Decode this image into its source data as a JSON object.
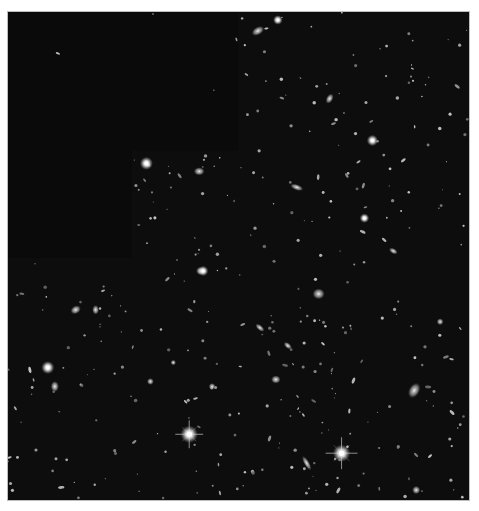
{
  "image": {
    "subject": "deep-field-galaxies",
    "background_color": "#0d0d0d",
    "masked_color": "#0a0a0a",
    "frame_border_color": "#bdbdbd",
    "frame": {
      "x": 7,
      "y": 11,
      "w": 463,
      "h": 490
    },
    "masked_regions": [
      {
        "x": 0,
        "y": 0,
        "w": 231,
        "h": 139
      },
      {
        "x": 0,
        "y": 139,
        "w": 124,
        "h": 108
      }
    ],
    "bright_stars": [
      {
        "x": 182,
        "y": 424,
        "r": 4,
        "spike": 14
      },
      {
        "x": 335,
        "y": 443,
        "r": 4,
        "spike": 16
      },
      {
        "x": 40,
        "y": 357,
        "r": 3,
        "spike": 0
      },
      {
        "x": 139,
        "y": 152,
        "r": 3,
        "spike": 0
      },
      {
        "x": 366,
        "y": 129,
        "r": 2.6,
        "spike": 0
      },
      {
        "x": 196,
        "y": 260,
        "r": 2.4,
        "spike": 0
      },
      {
        "x": 271,
        "y": 8,
        "r": 2.2,
        "spike": 0
      },
      {
        "x": 358,
        "y": 207,
        "r": 2.2,
        "spike": 0
      }
    ],
    "galaxies": [
      {
        "x": 251,
        "y": 19,
        "rx": 5,
        "ry": 3,
        "rot": -30
      },
      {
        "x": 323,
        "y": 87,
        "rx": 4,
        "ry": 2.5,
        "rot": -60
      },
      {
        "x": 290,
        "y": 176,
        "rx": 5,
        "ry": 2.2,
        "rot": 20
      },
      {
        "x": 192,
        "y": 160,
        "rx": 4,
        "ry": 3,
        "rot": 0
      },
      {
        "x": 312,
        "y": 283,
        "rx": 4.5,
        "ry": 4,
        "rot": 0
      },
      {
        "x": 281,
        "y": 335,
        "rx": 3.5,
        "ry": 2,
        "rot": 40
      },
      {
        "x": 68,
        "y": 299,
        "rx": 4,
        "ry": 3,
        "rot": -30
      },
      {
        "x": 408,
        "y": 380,
        "rx": 4,
        "ry": 6,
        "rot": 30
      },
      {
        "x": 269,
        "y": 369,
        "rx": 3.5,
        "ry": 3,
        "rot": 0
      },
      {
        "x": 300,
        "y": 453,
        "rx": 2,
        "ry": 6,
        "rot": -30
      },
      {
        "x": 410,
        "y": 480,
        "rx": 3,
        "ry": 3,
        "rot": 0
      },
      {
        "x": 47,
        "y": 376,
        "rx": 3,
        "ry": 4,
        "rot": 0
      },
      {
        "x": 143,
        "y": 371,
        "rx": 2.5,
        "ry": 2.5,
        "rot": 0
      },
      {
        "x": 88,
        "y": 299,
        "rx": 2.5,
        "ry": 3.5,
        "rot": 0
      },
      {
        "x": 193,
        "y": 260,
        "rx": 3,
        "ry": 3,
        "rot": 0
      },
      {
        "x": 253,
        "y": 317,
        "rx": 2,
        "ry": 4,
        "rot": -50
      },
      {
        "x": 387,
        "y": 240,
        "rx": 3.5,
        "ry": 2,
        "rot": 30
      },
      {
        "x": 434,
        "y": 311,
        "rx": 2.5,
        "ry": 2.5,
        "rot": 0
      },
      {
        "x": 205,
        "y": 376,
        "rx": 2.5,
        "ry": 2.5,
        "rot": 0
      },
      {
        "x": 166,
        "y": 352,
        "rx": 2,
        "ry": 2,
        "rot": 0
      }
    ],
    "faint_count": 420,
    "faint_seed": 7
  }
}
